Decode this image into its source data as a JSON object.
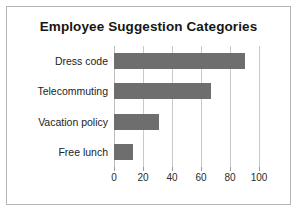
{
  "chart_data": {
    "type": "bar",
    "orientation": "horizontal",
    "title": "Employee Suggestion Categories",
    "xlabel": "",
    "ylabel": "",
    "categories": [
      "Dress code",
      "Telecommuting",
      "Vacation policy",
      "Free lunch"
    ],
    "values": [
      90,
      67,
      31,
      13
    ],
    "xticks": [
      "0",
      "20",
      "40",
      "60",
      "80",
      "100"
    ],
    "xtick_values": [
      0,
      20,
      40,
      60,
      80,
      100
    ],
    "xlim": [
      0,
      100
    ],
    "grid": true,
    "legend": false,
    "bar_color": "#6e6e6e",
    "gridline_color": "#c9c9c9",
    "frame_color": "#b5b5b5",
    "background_color": "#ffffff"
  }
}
